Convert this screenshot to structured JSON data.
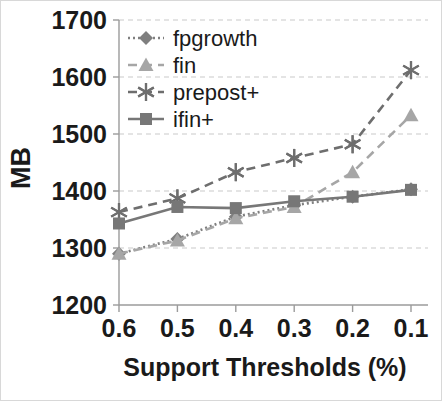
{
  "chart_data": {
    "type": "line",
    "title": "",
    "xlabel": "Support Thresholds (%)",
    "ylabel": "MB",
    "categories": [
      "0.6",
      "0.5",
      "0.4",
      "0.3",
      "0.2",
      "0.1"
    ],
    "x_tick_labels": [
      "0.6",
      "0.5",
      "0.4",
      "0.3",
      "0.2",
      "0.1"
    ],
    "y_tick_labels": [
      "1200",
      "1300",
      "1400",
      "1500",
      "1600",
      "1700"
    ],
    "ylim": [
      1200,
      1700
    ],
    "y_ticks": [
      1200,
      1300,
      1400,
      1500,
      1600,
      1700
    ],
    "grid": true,
    "grid_axis": "y",
    "legend_position": "upper-left-inside",
    "series": [
      {
        "name": "fpgrowth",
        "values": [
          1290,
          1316,
          1355,
          1375,
          1390,
          1403
        ],
        "color": "#7f7f7f",
        "marker": "diamond",
        "line_style": "dotted"
      },
      {
        "name": "fin",
        "values": [
          1290,
          1313,
          1352,
          1372,
          1433,
          1533
        ],
        "color": "#a6a6a6",
        "marker": "triangle",
        "line_style": "dashed"
      },
      {
        "name": "prepost+",
        "values": [
          1363,
          1387,
          1433,
          1458,
          1482,
          1612
        ],
        "color": "#6e6e6e",
        "marker": "asterisk",
        "line_style": "dashed"
      },
      {
        "name": "ifin+",
        "values": [
          1343,
          1372,
          1370,
          1382,
          1390,
          1402
        ],
        "color": "#777777",
        "marker": "square",
        "line_style": "solid"
      }
    ]
  },
  "legend": {
    "items": [
      {
        "label": "fpgrowth"
      },
      {
        "label": "fin"
      },
      {
        "label": "prepost+"
      },
      {
        "label": "ifin+"
      }
    ]
  },
  "axes": {
    "y_title": "MB",
    "x_title": "Support Thresholds (%)"
  }
}
